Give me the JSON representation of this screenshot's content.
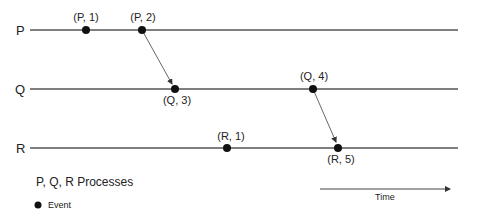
{
  "processes": [
    {
      "label": "P",
      "y": 30
    },
    {
      "label": "Q",
      "y": 89
    },
    {
      "label": "R",
      "y": 148
    }
  ],
  "events": [
    {
      "label": "(P, 1)",
      "process": "P",
      "x": 86,
      "y": 30,
      "label_pos": "above"
    },
    {
      "label": "(P, 2)",
      "process": "P",
      "x": 142,
      "y": 30,
      "label_pos": "above"
    },
    {
      "label": "(Q, 3)",
      "process": "Q",
      "x": 175,
      "y": 89,
      "label_pos": "below"
    },
    {
      "label": "(Q, 4)",
      "process": "Q",
      "x": 313,
      "y": 89,
      "label_pos": "above"
    },
    {
      "label": "(R, 1)",
      "process": "R",
      "x": 227,
      "y": 148,
      "label_pos": "above"
    },
    {
      "label": "(R, 5)",
      "process": "R",
      "x": 338,
      "y": 148,
      "label_pos": "below"
    }
  ],
  "messages": [
    {
      "from": "(P, 2)",
      "to": "(Q, 3)"
    },
    {
      "from": "(Q, 4)",
      "to": "(R, 5)"
    }
  ],
  "legend": {
    "processes_text": "P, Q, R  Processes",
    "event_text": "Event"
  },
  "time_axis": {
    "label": "Time"
  },
  "colors": {
    "line": "#555555",
    "event": "#111111",
    "text": "#222222"
  }
}
